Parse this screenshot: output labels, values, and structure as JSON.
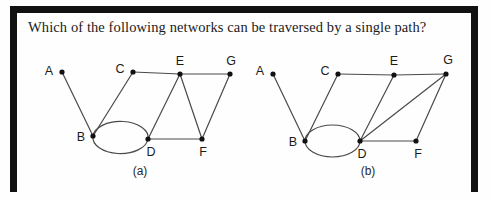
{
  "page": {
    "background_color": "#fefefe",
    "frame_color": "#111111"
  },
  "question": {
    "text": "Which of the following networks can be traversed by a single path?"
  },
  "diagrams": [
    {
      "id": "a",
      "caption": "(a)",
      "caption_x": 140,
      "caption_y": 164,
      "nodes": [
        {
          "id": "A",
          "label": "A",
          "x": 62,
          "y": 72,
          "label_x": 49,
          "label_y": 72
        },
        {
          "id": "B",
          "label": "B",
          "x": 93,
          "y": 136,
          "label_x": 81,
          "label_y": 138
        },
        {
          "id": "C",
          "label": "C",
          "x": 133,
          "y": 72,
          "label_x": 120,
          "label_y": 70
        },
        {
          "id": "D",
          "label": "D",
          "x": 148,
          "y": 139,
          "label_x": 151,
          "label_y": 153
        },
        {
          "id": "E",
          "label": "E",
          "x": 180,
          "y": 74,
          "label_x": 180,
          "label_y": 62
        },
        {
          "id": "F",
          "label": "F",
          "x": 202,
          "y": 139,
          "label_x": 203,
          "label_y": 153
        },
        {
          "id": "G",
          "label": "G",
          "x": 230,
          "y": 74,
          "label_x": 231,
          "label_y": 62
        }
      ],
      "edges": [
        {
          "from": "A",
          "to": "B",
          "kind": "line"
        },
        {
          "from": "C",
          "to": "B",
          "kind": "line"
        },
        {
          "from": "C",
          "to": "E",
          "kind": "line"
        },
        {
          "from": "E",
          "to": "G",
          "kind": "line"
        },
        {
          "from": "E",
          "to": "D",
          "kind": "line"
        },
        {
          "from": "E",
          "to": "F",
          "kind": "line"
        },
        {
          "from": "G",
          "to": "F",
          "kind": "line"
        },
        {
          "from": "D",
          "to": "F",
          "kind": "line"
        },
        {
          "from": "B",
          "to": "D",
          "kind": "double-arc-ellipse"
        }
      ]
    },
    {
      "id": "b",
      "caption": "(b)",
      "caption_x": 368,
      "caption_y": 164,
      "nodes": [
        {
          "id": "A",
          "label": "A",
          "x": 273,
          "y": 74,
          "label_x": 260,
          "label_y": 72
        },
        {
          "id": "B",
          "label": "B",
          "x": 305,
          "y": 141,
          "label_x": 293,
          "label_y": 143
        },
        {
          "id": "C",
          "label": "C",
          "x": 338,
          "y": 74,
          "label_x": 325,
          "label_y": 72
        },
        {
          "id": "D",
          "label": "D",
          "x": 360,
          "y": 141,
          "label_x": 362,
          "label_y": 155
        },
        {
          "id": "E",
          "label": "E",
          "x": 394,
          "y": 75,
          "label_x": 394,
          "label_y": 62
        },
        {
          "id": "F",
          "label": "F",
          "x": 416,
          "y": 141,
          "label_x": 418,
          "label_y": 155
        },
        {
          "id": "G",
          "label": "G",
          "x": 446,
          "y": 74,
          "label_x": 448,
          "label_y": 61
        }
      ],
      "edges": [
        {
          "from": "A",
          "to": "B",
          "kind": "line"
        },
        {
          "from": "C",
          "to": "B",
          "kind": "line"
        },
        {
          "from": "C",
          "to": "E",
          "kind": "line"
        },
        {
          "from": "E",
          "to": "G",
          "kind": "line"
        },
        {
          "from": "E",
          "to": "D",
          "kind": "line"
        },
        {
          "from": "G",
          "to": "D",
          "kind": "line"
        },
        {
          "from": "G",
          "to": "F",
          "kind": "line"
        },
        {
          "from": "D",
          "to": "F",
          "kind": "line"
        },
        {
          "from": "B",
          "to": "D",
          "kind": "double-arc-ellipse"
        }
      ]
    }
  ],
  "style": {
    "edge_color": "#4a4a4a",
    "node_color": "#111111",
    "node_radius": 2.6,
    "edge_width": 1.2,
    "label_color": "#1b1b1b",
    "label_font_size": 12.5
  }
}
